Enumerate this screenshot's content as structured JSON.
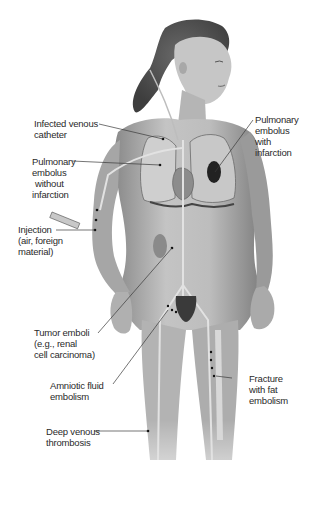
{
  "diagram": {
    "palette": {
      "skin_light": "#d6d6d6",
      "skin_mid": "#a8a8a8",
      "skin_dark": "#6e6e6e",
      "vessel": "#c9c9c9",
      "line": "#3a3a3a",
      "infarct": "#1e1e1e",
      "text": "#2a2a2a"
    },
    "labels": [
      {
        "id": "infected-venous-catheter",
        "lines": [
          "Infected venous",
          "catheter"
        ]
      },
      {
        "id": "pe-without-infarction",
        "lines": [
          "Pulmonary",
          "embolus",
          "without",
          "infarction"
        ]
      },
      {
        "id": "pe-with-infarction",
        "lines": [
          "Pulmonary",
          "embolus",
          "with",
          "infarction"
        ]
      },
      {
        "id": "injection",
        "lines": [
          "Injection",
          "(air, foreign",
          "material)"
        ]
      },
      {
        "id": "tumor-emboli",
        "lines": [
          "Tumor emboli",
          "(e.g., renal",
          "cell carcinoma)"
        ]
      },
      {
        "id": "amniotic-fluid-embolism",
        "lines": [
          "Amniotic fluid",
          "embolism"
        ]
      },
      {
        "id": "fracture-fat-embolism",
        "lines": [
          "Fracture",
          "with fat",
          "embolism"
        ]
      },
      {
        "id": "deep-venous-thrombosis",
        "lines": [
          "Deep venous",
          "thrombosis"
        ]
      }
    ]
  }
}
